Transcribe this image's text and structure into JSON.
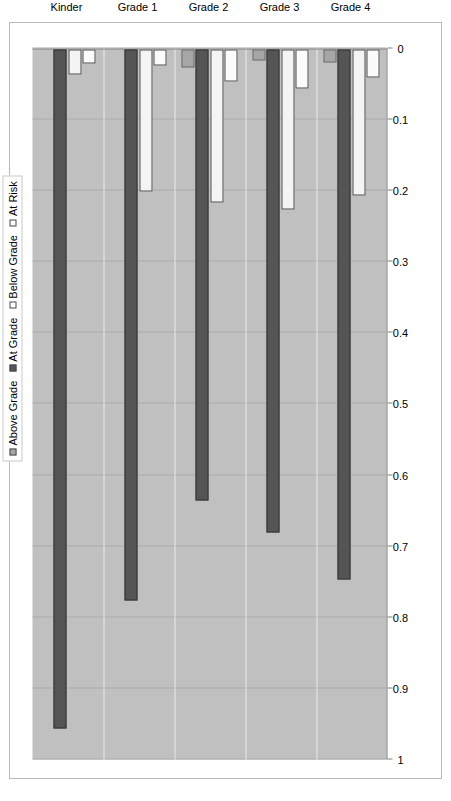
{
  "chart_data": {
    "type": "bar",
    "orientation": "horizontal",
    "title": "",
    "xlabel": "",
    "ylabel": "",
    "categories": [
      "Kinder",
      "Grade 1",
      "Grade 2",
      "Grade 3",
      "Grade 4"
    ],
    "series": [
      {
        "name": "Above Grade",
        "color": "#a6a6a6",
        "values": [
          0.0,
          0.0,
          0.025,
          0.015,
          0.018
        ]
      },
      {
        "name": "At Grade",
        "color": "#555555",
        "values": [
          0.955,
          0.775,
          0.635,
          0.68,
          0.745
        ]
      },
      {
        "name": "Below Grade",
        "color": "#ffffff",
        "values": [
          0.035,
          0.2,
          0.215,
          0.225,
          0.205
        ]
      },
      {
        "name": "At Risk",
        "color": "#ffffff",
        "values": [
          0.02,
          0.022,
          0.045,
          0.055,
          0.04
        ]
      }
    ],
    "value_axis": {
      "min": 0,
      "max": 1,
      "reversed": true,
      "ticks": [
        "1",
        "0.9",
        "0.8",
        "0.7",
        "0.6",
        "0.5",
        "0.4",
        "0.3",
        "0.2",
        "0.1",
        "0"
      ],
      "tick_values": [
        1,
        0.9,
        0.8,
        0.7,
        0.6,
        0.5,
        0.4,
        0.3,
        0.2,
        0.1,
        0
      ]
    },
    "grid": true,
    "legend": {
      "position": "top",
      "entries": [
        "Above Grade",
        "At Grade",
        "Below Grade",
        "At Risk"
      ]
    },
    "plot_background": "#c0c0c0",
    "page_background": "#ffffff"
  }
}
